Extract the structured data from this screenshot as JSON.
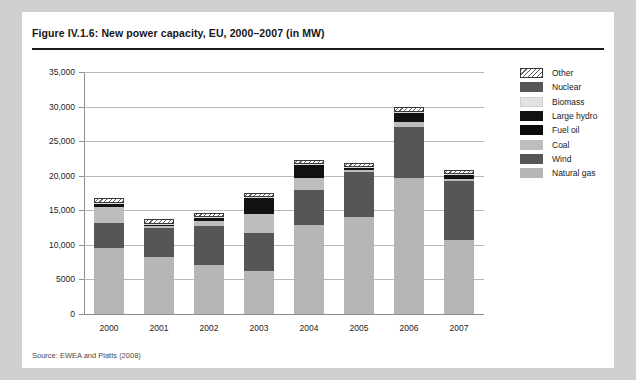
{
  "figure": {
    "title": "Figure IV.1.6: New power capacity, EU, 2000–2007 (in MW)",
    "source": "Source: EWEA and Platts (2008)"
  },
  "chart_data": {
    "type": "bar",
    "stacked": true,
    "title": "Figure IV.1.6: New power capacity, EU, 2000–2007 (in MW)",
    "xlabel": "",
    "ylabel": "",
    "unit": "MW",
    "ylim": [
      0,
      35000
    ],
    "ytick_values": [
      0,
      5000,
      10000,
      15000,
      20000,
      25000,
      30000,
      35000
    ],
    "ytick_labels": [
      "0",
      "5000",
      "10,000",
      "15,000",
      "20,000",
      "25,000",
      "30,000",
      "35,000"
    ],
    "grid": true,
    "legend_position": "right",
    "categories": [
      "2000",
      "2001",
      "2002",
      "2003",
      "2004",
      "2005",
      "2006",
      "2007"
    ],
    "series": [
      {
        "name": "Natural gas",
        "color": "#b6b6b6",
        "values": [
          9600,
          8300,
          7100,
          6200,
          12900,
          14100,
          19600,
          10700
        ]
      },
      {
        "name": "Wind",
        "color": "#565656",
        "values": [
          3500,
          4100,
          5700,
          5500,
          5100,
          6400,
          7500,
          8500
        ]
      },
      {
        "name": "Coal",
        "color": "#bdbdbd",
        "values": [
          2400,
          300,
          700,
          2800,
          1700,
          300,
          700,
          300
        ]
      },
      {
        "name": "Fuel oil",
        "color": "#111111",
        "values": [
          300,
          150,
          250,
          2100,
          1700,
          150,
          1100,
          450
        ]
      },
      {
        "name": "Large hydro",
        "color": "#111111",
        "values": [
          120,
          100,
          180,
          180,
          150,
          150,
          180,
          150
        ]
      },
      {
        "name": "Biomass",
        "color": "#dcdcdc",
        "values": [
          120,
          120,
          160,
          150,
          150,
          180,
          200,
          150
        ]
      },
      {
        "name": "Nuclear",
        "color": "#565656",
        "values": [
          0,
          0,
          0,
          0,
          0,
          0,
          0,
          0
        ]
      },
      {
        "name": "Other",
        "color": "hatch",
        "values": [
          700,
          700,
          550,
          550,
          600,
          550,
          600,
          600
        ]
      }
    ],
    "totals": [
      16740,
      13770,
      14640,
      17480,
      22300,
      21830,
      29880,
      20850
    ]
  },
  "legend": {
    "items": [
      {
        "label": "Other",
        "swatch": "hatch"
      },
      {
        "label": "Nuclear",
        "swatch": "#565656"
      },
      {
        "label": "Biomass",
        "swatch": "#e2e2e2"
      },
      {
        "label": "Large hydro",
        "swatch": "#111111"
      },
      {
        "label": "Fuel oil",
        "swatch": "#0a0a0a"
      },
      {
        "label": "Coal",
        "swatch": "#bdbdbd"
      },
      {
        "label": "Wind",
        "swatch": "#565656"
      },
      {
        "label": "Natural gas",
        "swatch": "#b6b6b6"
      }
    ]
  }
}
